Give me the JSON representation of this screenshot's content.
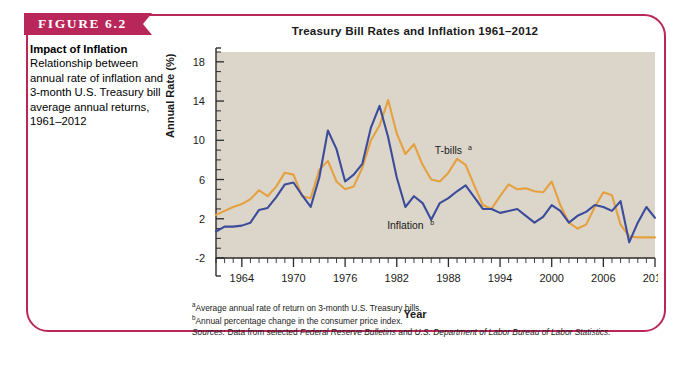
{
  "figure": {
    "banner_label": "FIGURE 6.2",
    "caption_title": "Impact of Inflation",
    "caption_body": "Relationship between annual rate of inflation and 3-month U.S. Treasury bill average annual returns, 1961–2012",
    "frame_color": "#b9275a",
    "banner_color": "#b9275a"
  },
  "footnotes": {
    "a_marker": "a",
    "a_text": "Average annual rate of return on 3-month U.S. Treasury bills.",
    "b_marker": "b",
    "b_text": "Annual percentage change in the consumer price index.",
    "sources_label": "Sources:",
    "sources_text_1": " Data from selected ",
    "sources_italic_1": "Federal Reserve Bulletins",
    "sources_text_2": " and ",
    "sources_italic_2": "U.S. Department of Labor Bureau of Labor Statistics.",
    "sources_full": "Sources: Data from selected Federal Reserve Bulletins and U.S. Department of Labor Bureau of Labor Statistics."
  },
  "chart_data": {
    "type": "line",
    "title": "Treasury Bill Rates and Inflation 1961–2012",
    "xlabel": "Year",
    "ylabel": "Annual Rate (%)",
    "xlim": [
      1961,
      2012
    ],
    "ylim": [
      -2,
      19
    ],
    "ytick_labels": [
      "18",
      "14",
      "10",
      "6",
      "2",
      "-2"
    ],
    "yticks": [
      18,
      14,
      10,
      6,
      2,
      -2
    ],
    "yticks_minor_step": 1,
    "xtick_labels": [
      "1964",
      "1970",
      "1976",
      "1982",
      "1988",
      "1994",
      "2000",
      "2006",
      "2012"
    ],
    "xticks": [
      1964,
      1970,
      1976,
      1982,
      1988,
      1994,
      2000,
      2006,
      2012
    ],
    "xticks_minor_step": 1,
    "grid": false,
    "legend_position": "inline-annotation",
    "plot_background": "#dcd5c9",
    "x": [
      1961,
      1962,
      1963,
      1964,
      1965,
      1966,
      1967,
      1968,
      1969,
      1970,
      1971,
      1972,
      1973,
      1974,
      1975,
      1976,
      1977,
      1978,
      1979,
      1980,
      1981,
      1982,
      1983,
      1984,
      1985,
      1986,
      1987,
      1988,
      1989,
      1990,
      1991,
      1992,
      1993,
      1994,
      1995,
      1996,
      1997,
      1998,
      1999,
      2000,
      2001,
      2002,
      2003,
      2004,
      2005,
      2006,
      2007,
      2008,
      2009,
      2010,
      2011,
      2012
    ],
    "series": [
      {
        "name": "T-bills",
        "label": "T-bills",
        "label_sup": "a",
        "color": "#e5a13f",
        "values": [
          2.4,
          2.8,
          3.2,
          3.5,
          4.0,
          4.9,
          4.3,
          5.3,
          6.7,
          6.5,
          4.3,
          4.1,
          7.0,
          7.9,
          5.8,
          5.0,
          5.3,
          7.2,
          10.0,
          11.5,
          14.1,
          10.7,
          8.6,
          9.6,
          7.5,
          6.0,
          5.8,
          6.7,
          8.1,
          7.5,
          5.4,
          3.4,
          3.0,
          4.3,
          5.5,
          5.0,
          5.1,
          4.8,
          4.7,
          5.8,
          3.4,
          1.6,
          1.0,
          1.4,
          3.2,
          4.7,
          4.4,
          1.4,
          0.2,
          0.1,
          0.1,
          0.1
        ],
        "marker_label_x": 1988,
        "marker_label_y": 8.6
      },
      {
        "name": "Inflation",
        "label": "Inflation",
        "label_sup": "b",
        "color": "#3b4c9b",
        "values": [
          0.7,
          1.2,
          1.2,
          1.3,
          1.6,
          2.9,
          3.1,
          4.2,
          5.5,
          5.7,
          4.4,
          3.2,
          6.2,
          11.0,
          9.1,
          5.8,
          6.5,
          7.6,
          11.3,
          13.5,
          10.3,
          6.2,
          3.2,
          4.3,
          3.6,
          1.9,
          3.6,
          4.1,
          4.8,
          5.4,
          4.2,
          3.0,
          3.0,
          2.6,
          2.8,
          3.0,
          2.3,
          1.6,
          2.2,
          3.4,
          2.8,
          1.6,
          2.3,
          2.7,
          3.4,
          3.2,
          2.8,
          3.8,
          -0.4,
          1.6,
          3.2,
          2.1
        ],
        "marker_label_x": 1983,
        "marker_label_y": 1.0
      }
    ]
  }
}
